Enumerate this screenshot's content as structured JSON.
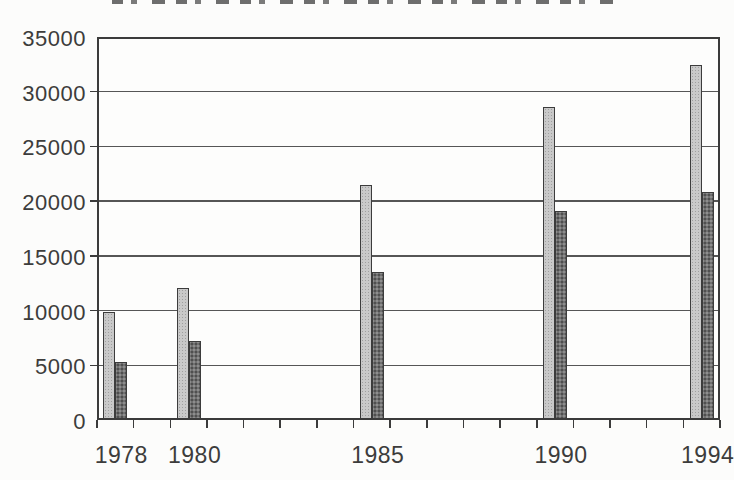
{
  "scan": {
    "background": "#fcfcfb",
    "axis_color": "#3b3b3b",
    "gridline_color": "#565656",
    "text_color": "#3c3c3c",
    "clipped_title_visible": true
  },
  "chart_data": {
    "type": "bar",
    "title": "",
    "categories": [
      "1978",
      "1980",
      "1985",
      "1990",
      "1994"
    ],
    "series": [
      {
        "name": "light-gray-series",
        "color": "#c9c9c9",
        "pattern": "fine-halftone",
        "values": [
          9900,
          12100,
          21500,
          28600,
          32400
        ]
      },
      {
        "name": "dark-gray-series",
        "color": "#707070",
        "pattern": "coarse-halftone",
        "values": [
          5300,
          7200,
          13500,
          19100,
          20800
        ]
      }
    ],
    "xlabel": "",
    "ylabel": "",
    "ylim": [
      0,
      35000
    ],
    "yticks": [
      0,
      5000,
      10000,
      15000,
      20000,
      25000,
      30000,
      35000
    ],
    "x_axis": {
      "minor_tick_year_start": 1978,
      "minor_tick_year_end": 1994,
      "minor_tick_every": 1
    },
    "grid": true,
    "legend": "none"
  }
}
